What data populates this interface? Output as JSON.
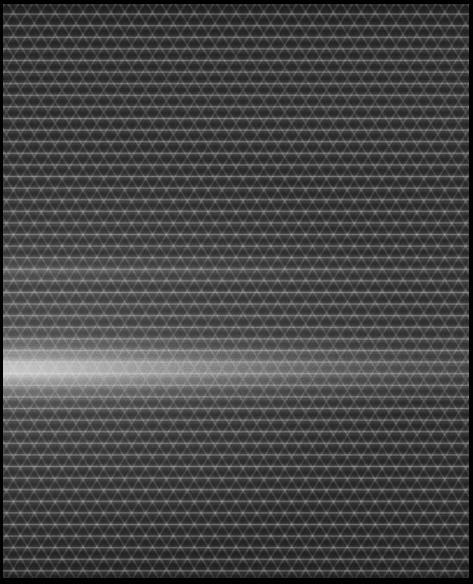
{
  "image": {
    "title": "Woven Mesh Specimen Scan",
    "kind": "grayscale-micrograph",
    "width_px": 473,
    "height_px": 584,
    "color_mode": "grayscale",
    "subject": "woven synthetic mesh fabric with diamond/X lattice weave",
    "description": "Dark grayscale scan of a woven mesh textile. Horizontal warp threads form regular bright hairlines across the full width, crossed by opposed diagonal weft threads producing a repeating X / diamond lattice. A broad bright horizontal illumination band crosses the lower-middle of the frame, brightest at the left edge and fading toward the right.",
    "orientation": "portrait"
  },
  "tones": {
    "frame_black": "#000000",
    "substrate_dark": "#242424",
    "substrate_mid": "#2e2e2e",
    "substrate_light": "#3a3a3a",
    "thread_highlight": "#8f8f8f",
    "band_peak": "#a8a8a8",
    "band_falloff": "#4a4a4a"
  },
  "structure": {
    "frame": {
      "label": "capture frame",
      "top_px": 4,
      "bottom_px": 6,
      "left_px": 3,
      "right_px": 4
    },
    "weave": {
      "label": "mesh weave lattice",
      "warp_line_spacing_px": 11.6,
      "warp_orientation": "horizontal",
      "weft_angle_deg": 58,
      "weft_angle_mirror_deg": -58,
      "cell_width_px": 12,
      "cell_height_px": 11.6,
      "pattern": "opposed diagonal X / diamond lattice"
    }
  },
  "features": [
    {
      "name": "primary-illumination-band",
      "label": "Primary bright horizontal band",
      "top_px": 334,
      "bottom_px": 416,
      "peak_y_px": 366,
      "brightest_x_px": 0,
      "falloff": "left-to-right",
      "peak_tone": "#a8a8a8"
    },
    {
      "name": "secondary-illumination-band",
      "label": "Faint secondary horizontal band",
      "top_px": 262,
      "bottom_px": 284,
      "peak_y_px": 272,
      "brightest_x_px": 0,
      "falloff": "left-to-right",
      "peak_tone": "#5a5a5a"
    }
  ]
}
